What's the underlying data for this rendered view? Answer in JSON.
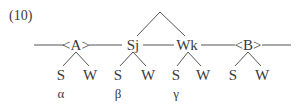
{
  "example_number": "(10)",
  "nodes": {
    "A": {
      "label": "<A>",
      "x": 76,
      "y": 45
    },
    "Sj": {
      "label": "Sj",
      "x": 133,
      "y": 45
    },
    "Wk": {
      "label": "Wk",
      "x": 187,
      "y": 45
    },
    "B": {
      "label": "<B>",
      "x": 248,
      "y": 45
    }
  },
  "leaves": [
    {
      "label": "S",
      "x": 61,
      "y": 75
    },
    {
      "label": "W",
      "x": 90,
      "y": 75
    },
    {
      "label": "S",
      "x": 118,
      "y": 75
    },
    {
      "label": "W",
      "x": 148,
      "y": 75
    },
    {
      "label": "S",
      "x": 176,
      "y": 75
    },
    {
      "label": "W",
      "x": 203,
      "y": 75
    },
    {
      "label": "S",
      "x": 233,
      "y": 75
    },
    {
      "label": "W",
      "x": 262,
      "y": 75
    }
  ],
  "greek": [
    {
      "label": "α",
      "x": 61,
      "y": 93
    },
    {
      "label": "β",
      "x": 118,
      "y": 93
    },
    {
      "label": "γ",
      "x": 176,
      "y": 93
    }
  ]
}
